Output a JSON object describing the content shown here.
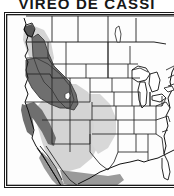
{
  "figure": {
    "title": "VIREO DE CASSI",
    "kind": "species-range-map",
    "region": "North America (western United States, southwestern Canada, Mexico)"
  },
  "colors": {
    "title_text": "#171717",
    "map_background": "#fdfdfd",
    "map_border": "#1a1a1a",
    "state_outline": "#222222",
    "coastline": "#111111",
    "breeding_range": "#6f6f6f",
    "migration_range": "#d4d4d4",
    "wintering_range": "#9a9a9a",
    "lake_fill": "#ffffff"
  },
  "ranges": [
    {
      "name": "breeding-range",
      "label": "Breeding range",
      "color": "#6f6f6f",
      "areas": "Southern interior British Columbia, Washington, Oregon, Idaho, western Montana, northern California, Sierra Nevada, coastal California"
    },
    {
      "name": "migration-range",
      "label": "Migration / passage range",
      "color": "#d4d4d4",
      "areas": "Great Basin, Nevada, Utah, Arizona, New Mexico, western Colorado, western Texas, southwestern British Columbia"
    },
    {
      "name": "wintering-range",
      "label": "Wintering range",
      "color": "#9a9a9a",
      "areas": "Baja California peninsula, Pacific slope of Mexico, Sinaloa to Oaxaca"
    }
  ],
  "map_features": {
    "country_borders": true,
    "state_borders": true,
    "great_lakes": true,
    "graticule": false
  }
}
